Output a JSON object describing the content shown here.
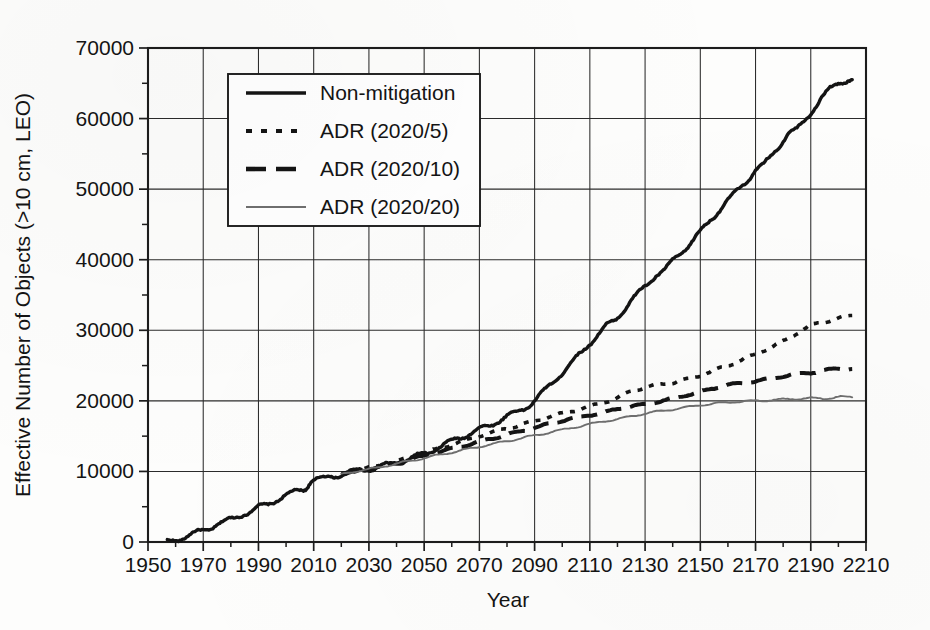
{
  "figure": {
    "background_color": "#fdfdfc",
    "ink_color": "#141414",
    "grey_series_color": "#6f6f6f"
  },
  "chart_data": {
    "type": "line",
    "title": "",
    "subtitle": "",
    "xlabel": "Year",
    "ylabel": "Effective Number of Objects (>10 cm, LEO)",
    "xlim": [
      1950,
      2210
    ],
    "ylim": [
      0,
      70000
    ],
    "xticks": [
      1950,
      1970,
      1990,
      2010,
      2030,
      2050,
      2070,
      2090,
      2110,
      2130,
      2150,
      2170,
      2190,
      2210
    ],
    "xtick_labels": [
      "1950",
      "1970",
      "1990",
      "2010",
      "2030",
      "2050",
      "2070",
      "2090",
      "2110",
      "2130",
      "2150",
      "2170",
      "2190",
      "2210"
    ],
    "yticks": [
      0,
      10000,
      20000,
      30000,
      40000,
      50000,
      60000,
      70000
    ],
    "ytick_labels": [
      "0",
      "10000",
      "20000",
      "30000",
      "40000",
      "50000",
      "60000",
      "70000"
    ],
    "x_minor_tick_interval": 10,
    "y_minor_tick_interval": 5000,
    "grid": true,
    "grid_axes": "both",
    "legend_position": "upper-left-inset",
    "series": [
      {
        "name": "Non-mitigation",
        "style": "solid",
        "color": "#141414",
        "linewidth": 3.4,
        "x": [
          1957,
          1960,
          1963,
          1966,
          1969,
          1972,
          1975,
          1978,
          1981,
          1984,
          1987,
          1990,
          1993,
          1996,
          1999,
          2002,
          2005,
          2007,
          2009,
          2011,
          2014,
          2017,
          2020,
          2023,
          2026,
          2029,
          2032,
          2035,
          2038,
          2041,
          2044,
          2047,
          2050,
          2053,
          2056,
          2059,
          2062,
          2065,
          2068,
          2071,
          2074,
          2077,
          2080,
          2083,
          2086,
          2089,
          2092,
          2095,
          2098,
          2101,
          2104,
          2107,
          2110,
          2113,
          2116,
          2119,
          2122,
          2125,
          2128,
          2131,
          2134,
          2137,
          2140,
          2143,
          2146,
          2149,
          2152,
          2155,
          2158,
          2161,
          2164,
          2167,
          2170,
          2173,
          2176,
          2179,
          2182,
          2185,
          2188,
          2191,
          2194,
          2197,
          2200,
          2203,
          2205
        ],
        "y": [
          0,
          300,
          700,
          1100,
          1500,
          1900,
          2600,
          2900,
          3300,
          3900,
          4300,
          4900,
          5300,
          5900,
          6400,
          6900,
          7400,
          7600,
          8700,
          8900,
          9000,
          9300,
          9600,
          9900,
          10100,
          10300,
          10500,
          10800,
          11000,
          11300,
          11700,
          12100,
          12500,
          13000,
          13500,
          14100,
          14700,
          15100,
          15600,
          16100,
          16600,
          17200,
          17800,
          18300,
          18900,
          19700,
          20800,
          22000,
          23200,
          24400,
          25600,
          26900,
          28200,
          29400,
          30600,
          31400,
          32800,
          34200,
          35400,
          36600,
          37900,
          38500,
          39800,
          41000,
          42200,
          43500,
          44800,
          46200,
          47600,
          48800,
          50000,
          51300,
          52700,
          53400,
          54900,
          56400,
          58000,
          58400,
          59900,
          61400,
          62900,
          64200,
          65100,
          65400,
          65500
        ]
      },
      {
        "name": "ADR (2020/5)",
        "style": "dotted",
        "color": "#141414",
        "linewidth": 3.6,
        "x": [
          2020,
          2025,
          2030,
          2035,
          2040,
          2045,
          2050,
          2055,
          2060,
          2065,
          2070,
          2075,
          2080,
          2085,
          2090,
          2095,
          2100,
          2105,
          2110,
          2115,
          2120,
          2125,
          2130,
          2135,
          2140,
          2145,
          2150,
          2155,
          2160,
          2165,
          2170,
          2175,
          2180,
          2185,
          2190,
          2195,
          2200,
          2205
        ],
        "y": [
          9600,
          10100,
          10500,
          10900,
          11400,
          12000,
          12600,
          13200,
          13800,
          14400,
          15000,
          15600,
          16100,
          16600,
          17100,
          17700,
          18200,
          18700,
          19200,
          19800,
          20400,
          21400,
          21900,
          22300,
          22600,
          23000,
          23600,
          24300,
          25000,
          25800,
          26600,
          27500,
          28400,
          29600,
          30700,
          31200,
          31700,
          32100
        ]
      },
      {
        "name": "ADR (2020/10)",
        "style": "dashed",
        "color": "#141414",
        "linewidth": 4.0,
        "x": [
          2020,
          2025,
          2030,
          2035,
          2040,
          2045,
          2050,
          2055,
          2060,
          2065,
          2070,
          2075,
          2080,
          2085,
          2090,
          2095,
          2100,
          2105,
          2110,
          2115,
          2120,
          2125,
          2130,
          2135,
          2140,
          2145,
          2150,
          2155,
          2160,
          2165,
          2170,
          2175,
          2180,
          2185,
          2190,
          2195,
          2200,
          2205
        ],
        "y": [
          9600,
          10000,
          10400,
          10800,
          11200,
          11700,
          12200,
          12700,
          13200,
          13700,
          14200,
          14700,
          15200,
          15700,
          16200,
          16700,
          17200,
          17600,
          18000,
          18300,
          18900,
          19200,
          19500,
          19900,
          20300,
          20800,
          21300,
          21800,
          22300,
          22500,
          22800,
          23100,
          23500,
          23800,
          24000,
          24300,
          24600,
          24500
        ]
      },
      {
        "name": "ADR (2020/20)",
        "style": "solid-thin-grey",
        "color": "#6f6f6f",
        "linewidth": 1.9,
        "x": [
          2020,
          2025,
          2030,
          2035,
          2040,
          2045,
          2050,
          2055,
          2060,
          2065,
          2070,
          2075,
          2080,
          2085,
          2090,
          2095,
          2100,
          2105,
          2110,
          2115,
          2120,
          2125,
          2130,
          2135,
          2140,
          2145,
          2150,
          2155,
          2160,
          2165,
          2170,
          2175,
          2180,
          2185,
          2190,
          2195,
          2200,
          2205
        ],
        "y": [
          9600,
          10000,
          10300,
          10700,
          11100,
          11500,
          11900,
          12300,
          12700,
          13100,
          13500,
          13900,
          14300,
          14700,
          15100,
          15500,
          15900,
          16300,
          16700,
          17100,
          17400,
          17800,
          18200,
          18500,
          18800,
          19100,
          19400,
          19600,
          19800,
          19900,
          20000,
          20100,
          20200,
          20300,
          20400,
          20300,
          20600,
          20500
        ]
      }
    ]
  },
  "legend": {
    "entries": [
      {
        "label": "Non-mitigation",
        "style": "solid",
        "color": "#141414"
      },
      {
        "label": "ADR (2020/5)",
        "style": "dotted",
        "color": "#141414"
      },
      {
        "label": "ADR (2020/10)",
        "style": "dashed",
        "color": "#141414"
      },
      {
        "label": "ADR (2020/20)",
        "style": "solid-thin-grey",
        "color": "#6f6f6f"
      }
    ]
  }
}
